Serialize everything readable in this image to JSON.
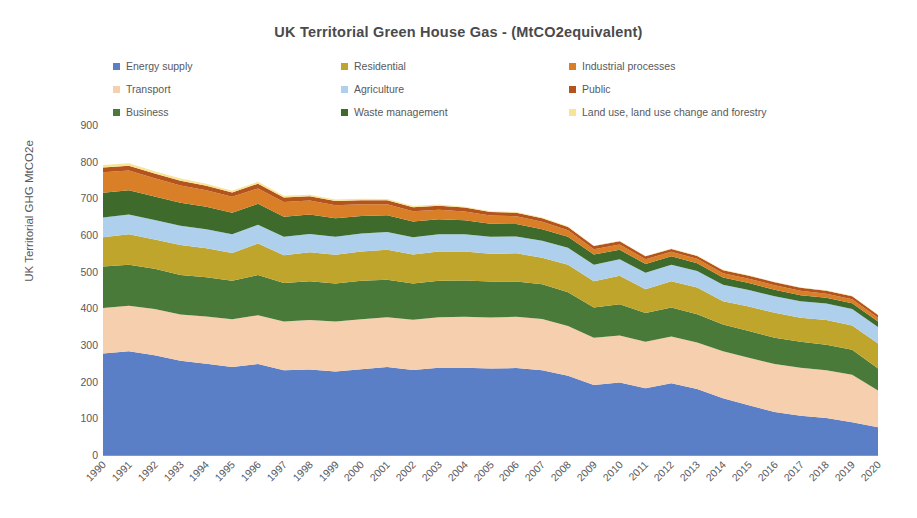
{
  "chart_data": {
    "type": "area",
    "stacked": true,
    "title": "UK Territorial Green House Gas - (MtCO2equivalent)",
    "xlabel": "",
    "ylabel": "UK Territorial GHG MtCO2e",
    "ylim": [
      0,
      900
    ],
    "ytick_step": 100,
    "yticks": [
      "900",
      "800",
      "700",
      "600",
      "500",
      "400",
      "300",
      "200",
      "100",
      "0"
    ],
    "grid": false,
    "legend_position": "top",
    "legend_columns": 3,
    "categories": [
      "1990",
      "1991",
      "1992",
      "1993",
      "1994",
      "1995",
      "1996",
      "1997",
      "1998",
      "1999",
      "2000",
      "2001",
      "2002",
      "2003",
      "2004",
      "2005",
      "2006",
      "2007",
      "2008",
      "2009",
      "2010",
      "2011",
      "2012",
      "2013",
      "2014",
      "2015",
      "2016",
      "2017",
      "2018",
      "2019",
      "2020"
    ],
    "series": [
      {
        "name": "Energy supply",
        "color": "#5b7fc7",
        "values": [
          277,
          283,
          272,
          257,
          249,
          240,
          248,
          231,
          233,
          228,
          234,
          240,
          232,
          238,
          238,
          236,
          237,
          231,
          216,
          191,
          198,
          182,
          196,
          180,
          155,
          136,
          117,
          107,
          101,
          89,
          76
        ]
      },
      {
        "name": "Transport",
        "color": "#f5cfae",
        "values": [
          124,
          124,
          126,
          126,
          129,
          130,
          133,
          133,
          135,
          136,
          136,
          136,
          137,
          138,
          139,
          139,
          140,
          140,
          136,
          129,
          128,
          127,
          127,
          127,
          128,
          129,
          131,
          131,
          130,
          130,
          100
        ]
      },
      {
        "name": "Business",
        "color": "#4a7a3a",
        "values": [
          113,
          112,
          110,
          108,
          107,
          105,
          110,
          105,
          106,
          104,
          105,
          102,
          99,
          99,
          99,
          98,
          96,
          95,
          92,
          82,
          85,
          78,
          79,
          77,
          73,
          73,
          72,
          71,
          70,
          68,
          60
        ]
      },
      {
        "name": "Residential",
        "color": "#bfa52c",
        "values": [
          80,
          83,
          80,
          82,
          79,
          76,
          86,
          76,
          79,
          78,
          80,
          82,
          79,
          80,
          79,
          76,
          77,
          72,
          75,
          72,
          78,
          65,
          72,
          73,
          63,
          67,
          68,
          65,
          67,
          66,
          68
        ]
      },
      {
        "name": "Agriculture",
        "color": "#aed0ec",
        "values": [
          54,
          54,
          53,
          52,
          52,
          51,
          51,
          50,
          50,
          49,
          49,
          48,
          47,
          47,
          47,
          46,
          46,
          46,
          46,
          45,
          45,
          45,
          45,
          45,
          45,
          45,
          45,
          45,
          45,
          45,
          45
        ]
      },
      {
        "name": "Waste management",
        "color": "#3e6b2b",
        "values": [
          67,
          66,
          64,
          63,
          61,
          59,
          57,
          55,
          53,
          51,
          48,
          46,
          43,
          41,
          38,
          36,
          34,
          32,
          30,
          28,
          26,
          24,
          23,
          21,
          20,
          19,
          18,
          17,
          16,
          16,
          15
        ]
      },
      {
        "name": "Industrial processes",
        "color": "#d97f28",
        "values": [
          56,
          54,
          50,
          47,
          45,
          43,
          42,
          40,
          38,
          35,
          32,
          30,
          28,
          26,
          24,
          22,
          21,
          20,
          18,
          14,
          14,
          13,
          12,
          12,
          12,
          12,
          12,
          12,
          11,
          11,
          10
        ]
      },
      {
        "name": "Public",
        "color": "#b5531c",
        "values": [
          13,
          13,
          13,
          13,
          12,
          12,
          13,
          12,
          12,
          12,
          11,
          11,
          11,
          11,
          11,
          10,
          10,
          10,
          9,
          9,
          9,
          8,
          8,
          8,
          8,
          8,
          8,
          8,
          8,
          8,
          8
        ]
      },
      {
        "name": "Land use, land use change and forestry",
        "color": "#f7e594",
        "values": [
          7,
          7,
          6,
          6,
          6,
          5,
          5,
          5,
          4,
          4,
          4,
          3,
          3,
          3,
          2,
          2,
          2,
          2,
          2,
          1,
          1,
          1,
          1,
          1,
          1,
          1,
          1,
          1,
          1,
          1,
          1
        ]
      }
    ]
  },
  "legend": {
    "items": [
      {
        "label": "Energy supply",
        "color": "#5b7fc7"
      },
      {
        "label": "Transport",
        "color": "#f5cfae"
      },
      {
        "label": "Business",
        "color": "#4a7a3a"
      },
      {
        "label": "Residential",
        "color": "#bfa52c"
      },
      {
        "label": "Agriculture",
        "color": "#aed0ec"
      },
      {
        "label": "Waste management",
        "color": "#3e6b2b"
      },
      {
        "label": "Industrial processes",
        "color": "#d97f28"
      },
      {
        "label": "Public",
        "color": "#b5531c"
      },
      {
        "label": "Land use, land use change and forestry",
        "color": "#f7e594"
      }
    ],
    "column_order": [
      0,
      3,
      6,
      1,
      4,
      7,
      2,
      5,
      8
    ]
  }
}
